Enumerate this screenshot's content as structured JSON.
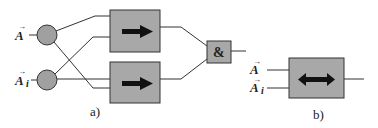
{
  "diagram": {
    "colors": {
      "box_fill": "#a8a8a8",
      "circle_fill": "#a0a0a0",
      "stroke": "#333333",
      "arrow": "#111111",
      "background": "#ffffff"
    },
    "part_a": {
      "caption": "a)",
      "inputs": [
        {
          "label": "A",
          "subscript": ""
        },
        {
          "label": "A",
          "subscript": "i"
        }
      ],
      "nodes": [
        "input-node-a",
        "input-node-ai"
      ],
      "blocks": [
        {
          "name": "top-direction-block",
          "symbol": "right-arrow"
        },
        {
          "name": "bottom-direction-block",
          "symbol": "right-arrow"
        }
      ],
      "gate": {
        "label": "&"
      }
    },
    "part_b": {
      "caption": "b)",
      "inputs": [
        {
          "label": "A",
          "subscript": ""
        },
        {
          "label": "A",
          "subscript": "i"
        }
      ],
      "block": {
        "name": "bidirectional-block",
        "symbol": "double-arrow"
      }
    }
  }
}
